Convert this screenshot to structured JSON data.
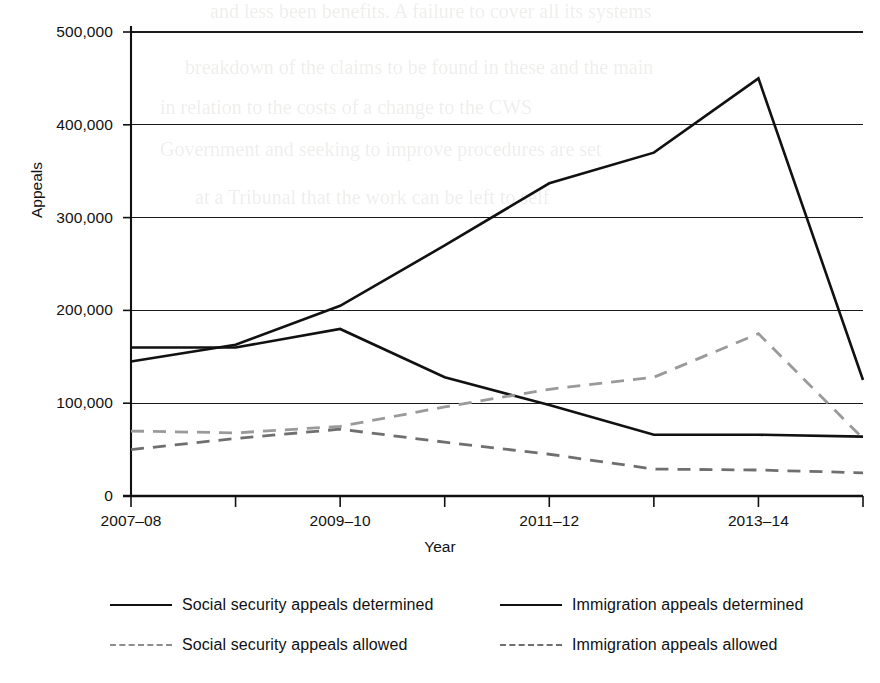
{
  "chart_data": {
    "type": "line",
    "title": "",
    "xlabel": "Year",
    "ylabel": "Appeals",
    "categories": [
      "2007-08",
      "2008-09",
      "2009-10",
      "2010-11",
      "2011-12",
      "2012-13",
      "2013-14",
      "2014-15"
    ],
    "xtick_labels": [
      "2007–08",
      "2009–10",
      "2011–12",
      "2013–14"
    ],
    "xtick_label_categories": [
      "2007-08",
      "2009-10",
      "2011-12",
      "2013-14"
    ],
    "ytick_labels": [
      "0",
      "100,000",
      "200,000",
      "300,000",
      "400,000",
      "500,000"
    ],
    "ytick_values": [
      0,
      100000,
      200000,
      300000,
      400000,
      500000
    ],
    "ylim": [
      0,
      500000
    ],
    "grid": "horizontal",
    "legend_position": "below",
    "series": [
      {
        "name": "Social security appeals determined",
        "style": "solid",
        "color": "#111111",
        "values": [
          145000,
          163000,
          205000,
          270000,
          337000,
          370000,
          450000,
          125000
        ]
      },
      {
        "name": "Immigration appeals determined",
        "style": "solid",
        "color": "#111111",
        "values": [
          160000,
          160000,
          180000,
          128000,
          98000,
          66000,
          66000,
          64000
        ]
      },
      {
        "name": "Social security appeals allowed",
        "style": "dashed",
        "color": "#9a9a9a",
        "values": [
          70000,
          68000,
          75000,
          96000,
          115000,
          128000,
          175000,
          62000
        ]
      },
      {
        "name": "Immigration appeals allowed",
        "style": "dashed",
        "color": "#6f6f6f",
        "values": [
          50000,
          62000,
          72000,
          58000,
          45000,
          29000,
          28000,
          25000
        ]
      }
    ]
  },
  "legend": {
    "items": [
      {
        "label": "Social security appeals determined",
        "style": "solid"
      },
      {
        "label": "Immigration appeals determined",
        "style": "solid"
      },
      {
        "label": "Social security appeals allowed",
        "style": "dashed"
      },
      {
        "label": "Immigration appeals allowed",
        "style": "dashed-dark"
      }
    ]
  },
  "axes": {
    "y_title": "Appeals",
    "x_title": "Year"
  },
  "background_text": {
    "lines": [
      "and less been benefits. A failure to cover all its systems",
      "breakdown of the claims to be found in these and the main",
      "in relation to the costs of a change to the CWS",
      "Government and seeking to improve procedures are set",
      "at a Tribunal that the work can be left to self"
    ]
  }
}
